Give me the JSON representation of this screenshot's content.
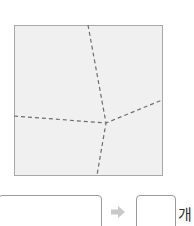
{
  "figure": {
    "name": "square-divided-by-dashed-lines",
    "fill_color": "#f0f0f0",
    "border_color": "#a8a8a8",
    "dash_color": "#6e6e6e"
  },
  "answer": {
    "expression_value": "",
    "count_value": "",
    "unit_label": "개",
    "arrow_color": "#c8c8c8"
  }
}
